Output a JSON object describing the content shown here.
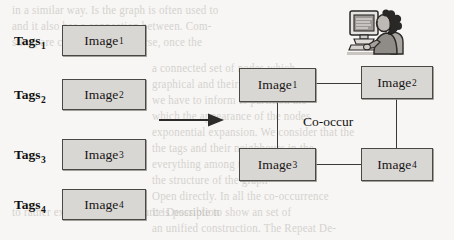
{
  "figure": {
    "width": 454,
    "height": 240,
    "background_color": "#f7f6f4",
    "box_fill_color": "#d9d7d4",
    "box_border_color": "#4a4845",
    "ink_color": "#171513"
  },
  "left_panel": {
    "title": "tag-image pairs",
    "rows": [
      {
        "tag_label": "Tags",
        "tag_index": "1",
        "image_label": "Image",
        "image_index": "1"
      },
      {
        "tag_label": "Tags",
        "tag_index": "2",
        "image_label": "Image",
        "image_index": "2"
      },
      {
        "tag_label": "Tags",
        "tag_index": "3",
        "image_label": "Image",
        "image_index": "3"
      },
      {
        "tag_label": "Tags",
        "tag_index": "4",
        "image_label": "Image",
        "image_index": "4"
      }
    ]
  },
  "transform_arrow": {
    "icon": "right-arrow-icon",
    "direction": "right"
  },
  "right_panel": {
    "title": "co-occurrence graph",
    "relation_label": "Co-occur",
    "nodes": [
      {
        "id": "n1",
        "image_label": "Image",
        "image_index": "1"
      },
      {
        "id": "n2",
        "image_label": "Image",
        "image_index": "2"
      },
      {
        "id": "n3",
        "image_label": "Image",
        "image_index": "3"
      },
      {
        "id": "n4",
        "image_label": "Image",
        "image_index": "4"
      }
    ],
    "edges": [
      {
        "from": "n1",
        "to": "n2"
      },
      {
        "from": "n1",
        "to": "n3"
      },
      {
        "from": "n2",
        "to": "n4"
      },
      {
        "from": "n3",
        "to": "n4"
      }
    ]
  },
  "clipart": {
    "name": "person-at-computer-icon",
    "description": "woman seated at a desktop computer"
  },
  "background_text": {
    "description": "faint bleed-through text from the reverse side of the scanned page",
    "lines": [
      "in a similar way. Is the graph is often used to",
      "and it also has a connection between. Com-",
      "sting, are considered. Of course, once the",
      "a connected set of nodes which",
      "graphical and their",
      "we have to inform to partition the",
      "which the appearance of the nodes",
      "exponential expansion. We consider that the",
      "the tags and their neighbours in the",
      "everything among the support. We",
      "the structure of the graph",
      "Open directly. In all the co-occurrence",
      "It is possible to show an set of",
      "an unified construction. The Repeat De-",
      "to rather expected. The Resource Description"
    ]
  }
}
